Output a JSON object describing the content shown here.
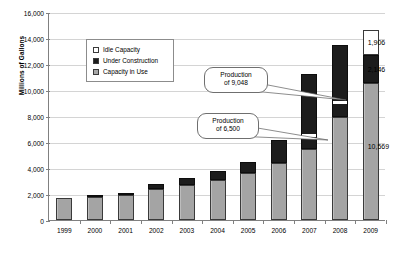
{
  "chart_data": {
    "type": "bar",
    "title": "",
    "xlabel": "",
    "ylabel": "Millions of Gallons",
    "ylim": [
      0,
      16000
    ],
    "ytick_step": 2000,
    "grid": true,
    "stacked": true,
    "legend_position": "inside-upper-left",
    "categories": [
      "1999",
      "2000",
      "2001",
      "2002",
      "2003",
      "2004",
      "2005",
      "2006",
      "2007",
      "2008",
      "2009"
    ],
    "ytick_labels": [
      "0",
      "2,000",
      "4,000",
      "6,000",
      "8,000",
      "10,000",
      "12,000",
      "14,000",
      "16,000"
    ],
    "series": [
      {
        "name": "Capacity in Use",
        "values": [
          1700,
          1780,
          1920,
          2350,
          2700,
          3100,
          3650,
          4350,
          5500,
          7950,
          10569
        ]
      },
      {
        "name": "Under Construction",
        "values": [
          0,
          50,
          100,
          390,
          500,
          650,
          780,
          1820,
          5700,
          5550,
          2146
        ]
      },
      {
        "name": "Idle Capacity",
        "values": [
          0,
          0,
          0,
          0,
          0,
          0,
          0,
          0,
          0,
          0,
          1906
        ]
      }
    ],
    "totals": [
      1700,
      1830,
      2020,
      2740,
      3200,
      3750,
      4430,
      6170,
      11200,
      13500,
      14621
    ],
    "data_labels": [
      {
        "category": "2009",
        "series": "Idle Capacity",
        "text": "1,906"
      },
      {
        "category": "2009",
        "series": "Under Construction",
        "text": "2,146"
      },
      {
        "category": "2009",
        "series": "Capacity in Use",
        "text": "10,569"
      }
    ],
    "annotations": [
      {
        "name": "production-2008",
        "line1": "Production",
        "line2": "of 9,048",
        "value": 9048,
        "points_to_category": "2008"
      },
      {
        "name": "production-2007",
        "line1": "Production",
        "line2": "of 6,500",
        "value": 6500,
        "points_to_category": "2007"
      }
    ],
    "colors": {
      "capacity_in_use": "#a8a8a8",
      "under_construction": "#1c1c1c",
      "idle_capacity": "#ffffff",
      "bar_outline": "#3a3a3a",
      "gridline": "#d4d4d4",
      "axis": "#808080",
      "text": "#000000",
      "background": "#ffffff"
    }
  },
  "legend": {
    "items": [
      {
        "label": "Idle Capacity",
        "swatch": "idle-capacity-swatch"
      },
      {
        "label": "Under Construction",
        "swatch": "under-construction-swatch"
      },
      {
        "label": "Capacity in Use",
        "swatch": "capacity-in-use-swatch"
      }
    ]
  },
  "axis": {
    "y_title": "Millions of Gallons"
  }
}
